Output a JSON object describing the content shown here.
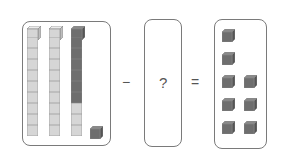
{
  "equation": {
    "minuend": {
      "rods_of_ten": 3,
      "rods": [
        {
          "light": 10,
          "dark": 0
        },
        {
          "light": 10,
          "dark": 0
        },
        {
          "light": 3,
          "dark": 7
        }
      ],
      "unit_cubes_dark": 1
    },
    "operator1": "−",
    "unknown": "?",
    "operator2": "=",
    "result": {
      "unit_cubes_dark": 8,
      "layout_rows": [
        1,
        1,
        2,
        2,
        2
      ]
    }
  },
  "colors": {
    "light_cube": "#d4d4d4",
    "dark_cube": "#6e6e6e",
    "border": "#7a7a7a"
  }
}
